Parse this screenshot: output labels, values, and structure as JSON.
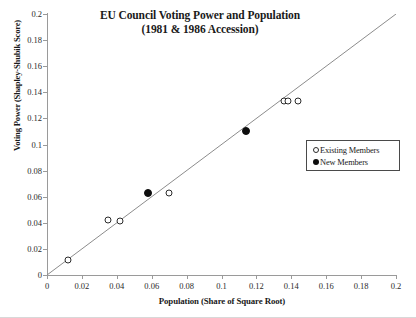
{
  "chart_data": {
    "type": "scatter",
    "title": "EU Council Voting Power and Population",
    "subtitle": "(1981 & 1986 Accession)",
    "xlabel": "Population  (Share of Square Root)",
    "ylabel": "Voting Power (Shapley-Shubik Score)",
    "xlim": [
      0,
      0.2
    ],
    "ylim": [
      0,
      0.2
    ],
    "xticks": [
      "0",
      "0.02",
      "0.04",
      "0.06",
      "0.08",
      "0.1",
      "0.12",
      "0.14",
      "0.16",
      "0.18",
      "0.2"
    ],
    "ytemp": "",
    "yticks": [
      "0",
      "0.02",
      "0.04",
      "0.06",
      "0.08",
      "0.1",
      "0.12",
      "0.14",
      "0.16",
      "0.18",
      "0.2"
    ],
    "xtick_values": [
      0,
      0.02,
      0.04,
      0.06,
      0.08,
      0.1,
      0.12,
      0.14,
      0.16,
      0.18,
      0.2
    ],
    "ytick_values": [
      0,
      0.02,
      0.04,
      0.06,
      0.08,
      0.1,
      0.12,
      0.14,
      0.16,
      0.18,
      0.2
    ],
    "grid": false,
    "legend_position": "right",
    "reference_line": {
      "type": "identity",
      "from": [
        0,
        0
      ],
      "to": [
        0.2,
        0.2
      ]
    },
    "series": [
      {
        "name": "Existing Members",
        "marker": "open-circle",
        "color": "#ffffff",
        "edge_color": "#2b2b2b",
        "points": [
          {
            "x": 0.012,
            "y": 0.0115
          },
          {
            "x": 0.035,
            "y": 0.042
          },
          {
            "x": 0.042,
            "y": 0.041
          },
          {
            "x": 0.07,
            "y": 0.063
          },
          {
            "x": 0.136,
            "y": 0.133
          },
          {
            "x": 0.138,
            "y": 0.133
          },
          {
            "x": 0.144,
            "y": 0.133
          }
        ]
      },
      {
        "name": "New Members",
        "marker": "filled-circle",
        "color": "#0d0d0d",
        "edge_color": "#0d0d0d",
        "points": [
          {
            "x": 0.058,
            "y": 0.063
          },
          {
            "x": 0.114,
            "y": 0.11
          }
        ]
      }
    ]
  },
  "legend": {
    "entries": [
      {
        "label": "Existing Members",
        "marker": "open-circle"
      },
      {
        "label": "New Members",
        "marker": "filled-circle"
      }
    ]
  }
}
